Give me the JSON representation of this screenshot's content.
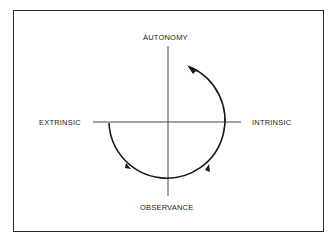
{
  "diagram": {
    "axes": {
      "top": "AUTONOMY",
      "bottom": "OBSERVANCE",
      "left": "EXTRINSIC",
      "right": "INTRINSIC"
    },
    "arrow_direction": "counterclockwise from EXTRINSIC through OBSERVANCE and INTRINSIC toward AUTONOMY",
    "colors": {
      "line": "#1a1a1a",
      "background": "#ffffff"
    }
  }
}
